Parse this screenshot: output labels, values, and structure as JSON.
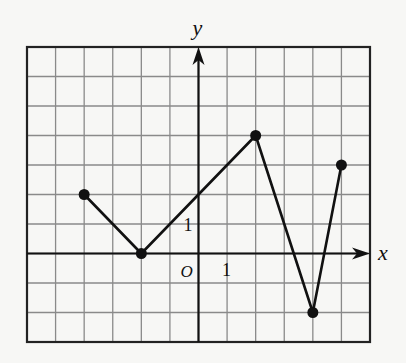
{
  "chart_data": {
    "type": "line",
    "title": "",
    "xlabel": "x",
    "ylabel": "y",
    "origin_label": "O",
    "tick_labels": {
      "x": "1",
      "y": "1"
    },
    "xlim": [
      -6,
      6
    ],
    "ylim": [
      -3,
      7
    ],
    "grid": true,
    "grid_step": 1,
    "legend": null,
    "series": [
      {
        "name": "piecewise-linear graph",
        "points": [
          [
            -4,
            2
          ],
          [
            -2,
            0
          ],
          [
            2,
            4
          ],
          [
            4,
            -2
          ],
          [
            5,
            3
          ]
        ],
        "markers": "filled-circle-at-each-vertex"
      }
    ]
  },
  "colors": {
    "background": "#f7f7f5",
    "grid": "#8a8a8a",
    "frame": "#222222",
    "axis": "#111111",
    "line": "#111111"
  }
}
